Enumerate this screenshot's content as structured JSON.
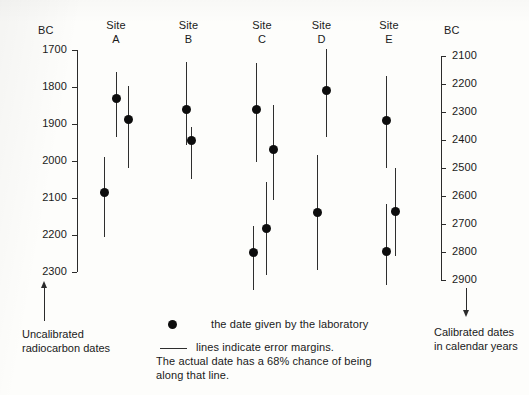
{
  "chart_data": {
    "type": "scatter",
    "title": "",
    "left_axis": {
      "label": "BC",
      "caption": "Uncalibrated\nradiocarbon dates",
      "ticks": [
        1700,
        1800,
        1900,
        2000,
        2100,
        2200,
        2300
      ],
      "range": [
        1700,
        2300
      ],
      "direction": "increasing-downward"
    },
    "right_axis": {
      "label": "BC",
      "caption": "Calibrated dates\nin calendar years",
      "ticks": [
        2100,
        2200,
        2300,
        2400,
        2500,
        2600,
        2700,
        2800,
        2900
      ],
      "range": [
        2100,
        2900
      ],
      "direction": "increasing-downward"
    },
    "ylabel": "BC",
    "xlabel": "",
    "grid": false,
    "legend": {
      "position": "bottom-center",
      "entries": [
        {
          "marker": "dot",
          "text": "the date given by the laboratory"
        },
        {
          "marker": "line",
          "text": "lines indicate error margins."
        }
      ],
      "note": "The actual date has a 68% chance of being\nalong that line."
    },
    "sites": [
      {
        "name": "Site",
        "sub": "A",
        "points": [
          {
            "date": 1830,
            "low": 1760,
            "high": 1935,
            "x_px": 116
          },
          {
            "date": 1888,
            "low": 1798,
            "high": 2018,
            "x_px": 128
          },
          {
            "date": 2085,
            "low": 1990,
            "high": 2205,
            "x_px": 104
          }
        ]
      },
      {
        "name": "Site",
        "sub": "B",
        "points": [
          {
            "date": 1862,
            "low": 1732,
            "high": 1956,
            "x_px": 186
          },
          {
            "date": 1945,
            "low": 1908,
            "high": 2050,
            "x_px": 191
          }
        ]
      },
      {
        "name": "Site",
        "sub": "C",
        "points": [
          {
            "date": 1862,
            "low": 1735,
            "high": 2003,
            "x_px": 256
          },
          {
            "date": 1970,
            "low": 1848,
            "high": 2105,
            "x_px": 273
          },
          {
            "date": 2183,
            "low": 2056,
            "high": 2307,
            "x_px": 266
          },
          {
            "date": 2248,
            "low": 2175,
            "high": 2348,
            "x_px": 253
          }
        ]
      },
      {
        "name": "Site",
        "sub": "D",
        "points": [
          {
            "date": 1810,
            "low": 1697,
            "high": 1935,
            "x_px": 326
          },
          {
            "date": 2140,
            "low": 1985,
            "high": 2295,
            "x_px": 317
          }
        ]
      },
      {
        "name": "Site",
        "sub": "E",
        "points": [
          {
            "date": 1890,
            "low": 1770,
            "high": 2018,
            "x_px": 386
          },
          {
            "date": 2137,
            "low": 2018,
            "high": 2258,
            "x_px": 395
          },
          {
            "date": 2244,
            "low": 2115,
            "high": 2335,
            "x_px": 386
          }
        ]
      }
    ]
  },
  "left_axis_header": "BC",
  "right_axis_header": "BC",
  "left_caption_line1": "Uncalibrated",
  "left_caption_line2": "radiocarbon dates",
  "right_caption_line1": "Calibrated dates",
  "right_caption_line2": "in calendar years",
  "legend_dot_text": "the date given by the laboratory",
  "legend_line_text": "lines indicate error margins.",
  "legend_note_line1": "The actual date has a 68% chance of being",
  "legend_note_line2": "along that line.",
  "site_headers": [
    {
      "name": "Site",
      "sub": "A"
    },
    {
      "name": "Site",
      "sub": "B"
    },
    {
      "name": "Site",
      "sub": "C"
    },
    {
      "name": "Site",
      "sub": "D"
    },
    {
      "name": "Site",
      "sub": "E"
    }
  ],
  "left_ticks": [
    "1700",
    "1800",
    "1900",
    "2000",
    "2100",
    "2200",
    "2300"
  ],
  "right_ticks": [
    "2100",
    "2200",
    "2300",
    "2400",
    "2500",
    "2600",
    "2700",
    "2800",
    "2900"
  ],
  "colors": {
    "ink": "#1a1a1a",
    "marker": "#0d0d0d",
    "axis": "#2b2b2b",
    "background": "#fdfdfb"
  }
}
